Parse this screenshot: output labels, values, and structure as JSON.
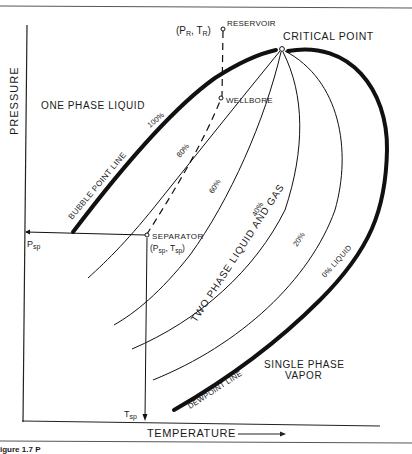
{
  "figure": {
    "type": "phase-diagram",
    "axes": {
      "x_label": "TEMPERATURE",
      "y_label": "PRESSURE",
      "x_arrow": "right-arrow-icon"
    },
    "regions": {
      "one_phase_liquid": "ONE PHASE LIQUID",
      "two_phase": "TWO PHASE LIQUID AND GAS",
      "single_phase_vapor_line1": "SINGLE PHASE",
      "single_phase_vapor_line2": "VAPOR"
    },
    "boundaries": {
      "bubble_point": "BUBBLE POINT LINE",
      "dewpoint": "DEWPOINT LINE"
    },
    "quality_lines": [
      {
        "label": "100%"
      },
      {
        "label": "80%"
      },
      {
        "label": "60%"
      },
      {
        "label": "40%"
      },
      {
        "label": "20%"
      },
      {
        "label": "0% LIQUID"
      }
    ],
    "points": {
      "critical": "CRITICAL POINT",
      "reservoir": "RESERVOIR",
      "reservoir_coords_open": "(P",
      "reservoir_coords_p_sub": "R",
      "reservoir_coords_mid": ", T",
      "reservoir_coords_t_sub": "R",
      "reservoir_coords_close": ")",
      "wellbore": "WELLBORE",
      "separator": "SEPARATOR",
      "separator_coords_open": "(P",
      "separator_coords_p_sub": "sp",
      "separator_coords_mid": ", T",
      "separator_coords_t_sub": "sp",
      "separator_coords_close": ")"
    },
    "axis_markers": {
      "p_sep": "P",
      "p_sep_sub": "sp",
      "t_sep": "T",
      "t_sep_sub": "sp"
    },
    "caption_fragment": "igure 1.7  P"
  }
}
